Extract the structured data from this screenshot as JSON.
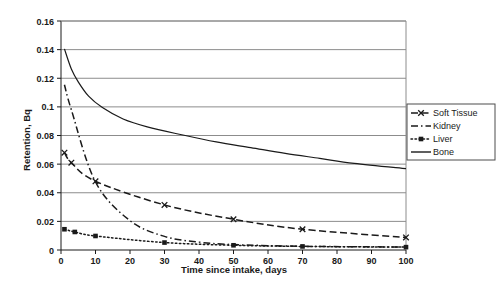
{
  "chart_data": {
    "type": "line",
    "title": "",
    "xlabel": "Time since intake, days",
    "ylabel": "Retention, Bq",
    "xlim": [
      0,
      100
    ],
    "ylim": [
      0,
      0.16
    ],
    "xticks": [
      "0",
      "10",
      "20",
      "30",
      "40",
      "50",
      "60",
      "70",
      "80",
      "90",
      "100"
    ],
    "xtick_values": [
      0,
      10,
      20,
      30,
      40,
      50,
      60,
      70,
      80,
      90,
      100
    ],
    "yticks": [
      "0",
      "0.02",
      "0.04",
      "0.06",
      "0.08",
      "0.1",
      "0.12",
      "0.14",
      "0.16"
    ],
    "ytick_values": [
      0,
      0.02,
      0.04,
      0.06,
      0.08,
      0.1,
      0.12,
      0.14,
      0.16
    ],
    "grid": "horizontal",
    "legend_position": "right",
    "series": [
      {
        "name": "Soft Tissue",
        "style": "dashed",
        "marker": "x",
        "color": "#1a1a1a",
        "x": [
          1,
          3,
          10,
          30,
          50,
          70,
          100
        ],
        "values": [
          0.068,
          0.061,
          0.048,
          0.0315,
          0.0215,
          0.0145,
          0.0088
        ]
      },
      {
        "name": "Kidney",
        "style": "dash-dot",
        "marker": "none",
        "color": "#1a1a1a",
        "x": [
          1,
          3,
          10,
          20,
          30,
          40,
          50,
          70,
          100
        ],
        "values": [
          0.1155,
          0.098,
          0.0475,
          0.0205,
          0.0095,
          0.0055,
          0.0038,
          0.0026,
          0.0021
        ]
      },
      {
        "name": "Liver",
        "style": "dotted",
        "marker": "square",
        "color": "#1a1a1a",
        "x": [
          1,
          4,
          10,
          30,
          50,
          70,
          100
        ],
        "values": [
          0.0145,
          0.0126,
          0.0098,
          0.0052,
          0.0033,
          0.0025,
          0.002
        ]
      },
      {
        "name": "Bone",
        "style": "solid",
        "marker": "none",
        "color": "#1a1a1a",
        "x": [
          1,
          3,
          5,
          8,
          12,
          18,
          25,
          35,
          45,
          55,
          65,
          75,
          85,
          100
        ],
        "values": [
          0.1405,
          0.1265,
          0.1175,
          0.1075,
          0.0995,
          0.0915,
          0.086,
          0.0805,
          0.0755,
          0.0715,
          0.0675,
          0.064,
          0.0605,
          0.0568
        ]
      }
    ],
    "colors": {
      "axis": "#1a1a1a",
      "grid": "#8c8c8c",
      "background": "#ffffff",
      "series": "#1a1a1a"
    }
  },
  "legend": {
    "entries": [
      {
        "label": "Soft Tissue"
      },
      {
        "label": "Kidney"
      },
      {
        "label": "Liver"
      },
      {
        "label": "Bone"
      }
    ]
  }
}
